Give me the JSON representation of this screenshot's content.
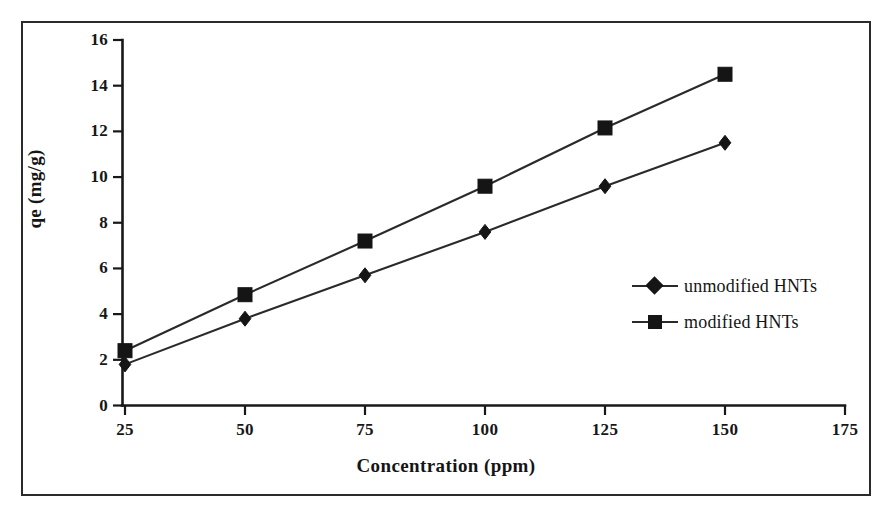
{
  "figure": {
    "background_color": "#ffffff",
    "frame_color": "#2b2b2b",
    "axis_color": "#181818",
    "series_color": "#2a2a2a"
  },
  "chart_data": {
    "type": "line",
    "title": "",
    "xlabel": "Concentration (ppm)",
    "ylabel": "qe (mg/g)",
    "x": [
      25,
      50,
      75,
      100,
      125,
      150
    ],
    "xlim": [
      25,
      175
    ],
    "ylim": [
      0,
      16
    ],
    "xticks": [
      25,
      50,
      75,
      100,
      125,
      150,
      175
    ],
    "yticks": [
      0,
      2,
      4,
      6,
      8,
      10,
      12,
      14,
      16
    ],
    "grid": false,
    "legend_position": "center-right",
    "series": [
      {
        "name": "unmodified HNTs",
        "marker": "diamond",
        "values": [
          1.8,
          3.8,
          5.7,
          7.6,
          9.6,
          11.5
        ]
      },
      {
        "name": "modified HNTs",
        "marker": "square",
        "values": [
          2.4,
          4.85,
          7.2,
          9.6,
          12.15,
          14.5
        ]
      }
    ]
  },
  "legend": {
    "items": [
      {
        "label": "unmodified HNTs",
        "marker": "diamond"
      },
      {
        "label": "modified HNTs",
        "marker": "square"
      }
    ]
  },
  "axis_labels": {
    "x_ticks": [
      "25",
      "50",
      "75",
      "100",
      "125",
      "150",
      "175"
    ],
    "y_ticks": [
      "0",
      "2",
      "4",
      "6",
      "8",
      "10",
      "12",
      "14",
      "16"
    ]
  }
}
